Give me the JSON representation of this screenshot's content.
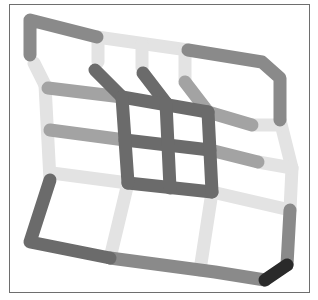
{
  "diagram": {
    "type": "deformed-grid",
    "frame": {
      "x": 9,
      "y": 4,
      "width": 301,
      "height": 289,
      "border_color": "#6e6e6e"
    },
    "stroke_width": 13,
    "colors": {
      "light": "#d9d9d9",
      "lighter": "#e3e3e3",
      "medium": "#a3a3a3",
      "mid_dark": "#8a8a8a",
      "dark": "#6b6b6b",
      "black": "#2a2a2a"
    },
    "segments": [
      {
        "id": "outer-top-left",
        "points": [
          [
            30,
            55
          ],
          [
            30,
            20
          ],
          [
            97,
            37
          ]
        ],
        "color": "mid_dark"
      },
      {
        "id": "outer-top-middle",
        "points": [
          [
            97,
            37
          ],
          [
            188,
            50
          ]
        ],
        "color": "lighter"
      },
      {
        "id": "outer-top-right",
        "points": [
          [
            188,
            50
          ],
          [
            262,
            62
          ],
          [
            280,
            78
          ],
          [
            280,
            120
          ]
        ],
        "color": "mid_dark"
      },
      {
        "id": "outer-left-upper-light",
        "points": [
          [
            34,
            63
          ],
          [
            45,
            85
          ]
        ],
        "color": "lighter"
      },
      {
        "id": "outer-left-lower",
        "points": [
          [
            45,
            85
          ],
          [
            50,
            180
          ]
        ],
        "color": "lighter"
      },
      {
        "id": "outer-right-light",
        "points": [
          [
            280,
            120
          ],
          [
            292,
            168
          ],
          [
            290,
            210
          ]
        ],
        "color": "lighter"
      },
      {
        "id": "outer-right-lower",
        "points": [
          [
            290,
            210
          ],
          [
            287,
            265
          ]
        ],
        "color": "mid_dark"
      },
      {
        "id": "outer-corner-black",
        "points": [
          [
            287,
            265
          ],
          [
            265,
            280
          ]
        ],
        "color": "black"
      },
      {
        "id": "outer-bottom",
        "points": [
          [
            265,
            280
          ],
          [
            215,
            272
          ],
          [
            200,
            270
          ],
          [
            110,
            258
          ]
        ],
        "color": "mid_dark"
      },
      {
        "id": "outer-bottom-left",
        "points": [
          [
            110,
            258
          ],
          [
            30,
            242
          ],
          [
            50,
            180
          ]
        ],
        "color": "dark"
      },
      {
        "id": "stub-top-1",
        "points": [
          [
            98,
            40
          ],
          [
            98,
            62
          ]
        ],
        "color": "lighter"
      },
      {
        "id": "stub-top-2",
        "points": [
          [
            142,
            45
          ],
          [
            142,
            68
          ]
        ],
        "color": "lighter"
      },
      {
        "id": "stub-top-3",
        "points": [
          [
            185,
            50
          ],
          [
            185,
            80
          ]
        ],
        "color": "lighter"
      },
      {
        "id": "row-1-left",
        "points": [
          [
            48,
            88
          ],
          [
            122,
            97
          ]
        ],
        "color": "medium"
      },
      {
        "id": "row-2-left",
        "points": [
          [
            50,
            130
          ],
          [
            125,
            140
          ]
        ],
        "color": "medium"
      },
      {
        "id": "row-3-left",
        "points": [
          [
            52,
            173
          ],
          [
            128,
            183
          ]
        ],
        "color": "lighter"
      },
      {
        "id": "row-1-right",
        "points": [
          [
            208,
            112
          ],
          [
            252,
            125
          ]
        ],
        "color": "medium"
      },
      {
        "id": "row-2-right",
        "points": [
          [
            210,
            150
          ],
          [
            258,
            162
          ]
        ],
        "color": "medium"
      },
      {
        "id": "row-1-right-light",
        "points": [
          [
            252,
            125
          ],
          [
            280,
            125
          ]
        ],
        "color": "lighter"
      },
      {
        "id": "row-2-right-light",
        "points": [
          [
            258,
            162
          ],
          [
            292,
            168
          ]
        ],
        "color": "lighter"
      },
      {
        "id": "row-3-right",
        "points": [
          [
            212,
            192
          ],
          [
            290,
            210
          ]
        ],
        "color": "lighter"
      },
      {
        "id": "diag-1",
        "points": [
          [
            95,
            70
          ],
          [
            122,
            97
          ]
        ],
        "color": "dark"
      },
      {
        "id": "diag-2",
        "points": [
          [
            143,
            73
          ],
          [
            166,
            103
          ]
        ],
        "color": "dark"
      },
      {
        "id": "diag-3-light",
        "points": [
          [
            185,
            82
          ],
          [
            208,
            112
          ]
        ],
        "color": "medium"
      },
      {
        "id": "inner-top",
        "points": [
          [
            122,
            97
          ],
          [
            208,
            112
          ]
        ],
        "color": "dark"
      },
      {
        "id": "inner-mid-h",
        "points": [
          [
            125,
            140
          ],
          [
            210,
            150
          ]
        ],
        "color": "dark"
      },
      {
        "id": "inner-bottom",
        "points": [
          [
            128,
            183
          ],
          [
            212,
            192
          ]
        ],
        "color": "dark"
      },
      {
        "id": "inner-left",
        "points": [
          [
            122,
            97
          ],
          [
            128,
            183
          ]
        ],
        "color": "dark"
      },
      {
        "id": "inner-mid-v",
        "points": [
          [
            166,
            103
          ],
          [
            170,
            188
          ]
        ],
        "color": "dark"
      },
      {
        "id": "inner-right",
        "points": [
          [
            208,
            112
          ],
          [
            212,
            192
          ]
        ],
        "color": "dark"
      },
      {
        "id": "col-lower-1",
        "points": [
          [
            128,
            183
          ],
          [
            110,
            258
          ]
        ],
        "color": "lighter"
      },
      {
        "id": "col-lower-2",
        "points": [
          [
            212,
            192
          ],
          [
            200,
            270
          ]
        ],
        "color": "lighter"
      }
    ]
  }
}
